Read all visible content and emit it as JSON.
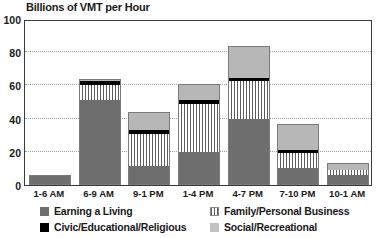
{
  "chart_data": {
    "type": "bar",
    "stacked": true,
    "title": "Billions of VMT per Hour",
    "xlabel": "",
    "ylabel": "",
    "ylim": [
      0,
      100
    ],
    "yticks": [
      0,
      20,
      40,
      60,
      80,
      100
    ],
    "ytick_labels": [
      "0",
      "20",
      "40",
      "60",
      "80",
      "100"
    ],
    "grid": true,
    "grid_style": "dotted-horizontal",
    "legend_position": "bottom",
    "categories": [
      "1-6 AM",
      "6-9 AM",
      "9-1 PM",
      "1-4 PM",
      "4-7 PM",
      "7-10 PM",
      "10-1 AM"
    ],
    "series": [
      {
        "name": "Earning a Living",
        "color": "#6e6e6e",
        "pattern": "solid-dark-gray",
        "values": [
          6,
          51.5,
          11.5,
          20,
          39.5,
          10,
          6
        ]
      },
      {
        "name": "Family/Personal Business",
        "color": "#5d5d5d",
        "pattern": "vertical-hatch",
        "values": [
          0,
          8.5,
          19.5,
          29,
          23,
          9,
          3
        ]
      },
      {
        "name": "Civic/Educational/Religious",
        "color": "#000000",
        "pattern": "solid-black",
        "values": [
          0,
          2.5,
          2,
          2.5,
          2,
          2,
          0
        ]
      },
      {
        "name": "Social/Recreational",
        "color": "#b7b7b7",
        "pattern": "solid-light-gray",
        "values": [
          0,
          1.5,
          11,
          9.5,
          19.5,
          16,
          4
        ]
      }
    ],
    "totals": [
      6,
      64,
      44,
      61,
      84,
      37,
      13
    ]
  },
  "legend": {
    "items": [
      {
        "label": "Earning a Living",
        "swatch": "earning"
      },
      {
        "label": "Family/Personal Business",
        "swatch": "family"
      },
      {
        "label": "Civic/Educational/Religious",
        "swatch": "civic"
      },
      {
        "label": "Social/Recreational",
        "swatch": "social"
      }
    ]
  }
}
